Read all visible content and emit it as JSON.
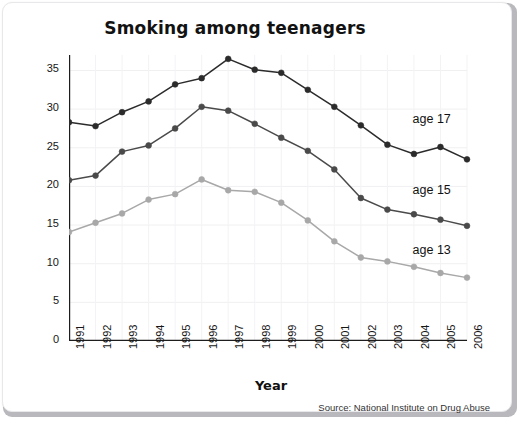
{
  "chart_data": {
    "type": "line",
    "title": "Smoking among teenagers",
    "xlabel": "Year",
    "ylabel": "Percentage of students",
    "source": "Source: National Institute on Drug Abuse",
    "grid": true,
    "legend_position": "inline-right",
    "x": [
      1991,
      1992,
      1993,
      1994,
      1995,
      1996,
      1997,
      1998,
      1999,
      2000,
      2001,
      2002,
      2003,
      2004,
      2005,
      2006
    ],
    "categories": [
      "1991",
      "1992",
      "1993",
      "1994",
      "1995",
      "1996",
      "1997",
      "1998",
      "1999",
      "2000",
      "2001",
      "2002",
      "2003",
      "2004",
      "2005",
      "2006"
    ],
    "xlim": [
      1991,
      2006
    ],
    "ylim": [
      0,
      37
    ],
    "yticks": [
      0,
      5,
      10,
      15,
      20,
      25,
      30,
      35
    ],
    "ytick_labels": [
      "0",
      "5",
      "10",
      "15",
      "20",
      "25",
      "30",
      "35"
    ],
    "series": [
      {
        "name": "age 17",
        "color": "#2b2b2b",
        "values": [
          28.3,
          27.8,
          29.6,
          31.0,
          33.2,
          34.0,
          36.5,
          35.1,
          34.7,
          32.5,
          30.3,
          27.9,
          25.4,
          24.2,
          25.1,
          23.5
        ]
      },
      {
        "name": "age 15",
        "color": "#4a4a4a",
        "values": [
          20.8,
          21.4,
          24.5,
          25.3,
          27.5,
          30.3,
          29.8,
          28.1,
          26.3,
          24.6,
          22.2,
          18.5,
          17.0,
          16.4,
          15.7,
          14.9
        ]
      },
      {
        "name": "age 13",
        "color": "#a8a8a8",
        "values": [
          14.1,
          15.3,
          16.5,
          18.3,
          19.0,
          20.9,
          19.5,
          19.3,
          17.9,
          15.6,
          12.9,
          10.8,
          10.3,
          9.6,
          8.8,
          8.2
        ]
      }
    ],
    "annotations": [
      {
        "text": "age 17",
        "x": 2004.1,
        "y": 28.6
      },
      {
        "text": "age 15",
        "x": 2004.1,
        "y": 19.4
      },
      {
        "text": "age 13",
        "x": 2004.1,
        "y": 11.7
      }
    ]
  }
}
